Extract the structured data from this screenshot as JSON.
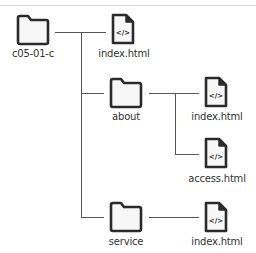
{
  "diagram": {
    "type": "directory-tree",
    "root": {
      "name": "c05-01-c",
      "kind": "folder",
      "children": [
        {
          "name": "index.html",
          "kind": "html-file"
        },
        {
          "name": "about",
          "kind": "folder",
          "children": [
            {
              "name": "index.html",
              "kind": "html-file"
            },
            {
              "name": "access.html",
              "kind": "html-file"
            }
          ]
        },
        {
          "name": "service",
          "kind": "folder",
          "children": [
            {
              "name": "index.html",
              "kind": "html-file"
            }
          ]
        }
      ]
    },
    "file_icon_glyph": "</>",
    "colors": {
      "icon_stroke": "#2b2b2b",
      "icon_fill": "#f7f7f7",
      "connector": "#555555",
      "label": "#333333",
      "divider": "#d6d6d6"
    }
  },
  "labels": {
    "root": "c05-01-c",
    "root_index": "index.html",
    "about": "about",
    "about_index": "index.html",
    "about_access": "access.html",
    "service": "service",
    "service_index": "index.html"
  },
  "glyph": "</>"
}
